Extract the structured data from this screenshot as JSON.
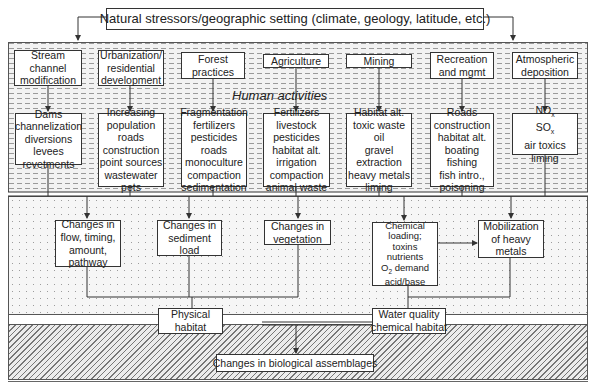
{
  "top": {
    "title": "Natural stressors/geographic setting (climate, geology, latitude, etc.)"
  },
  "human_activities": {
    "label": "Human activities",
    "categories": [
      {
        "label": [
          "Stream",
          "channel",
          "modification"
        ],
        "details": [
          "Dams",
          "channelization",
          "diversions",
          "levees",
          "revetments"
        ]
      },
      {
        "label": [
          "Urbanization/",
          "residential",
          "development"
        ],
        "details": [
          "Increasing",
          "population",
          "roads",
          "construction",
          "point sources",
          "wastewater",
          "pets"
        ]
      },
      {
        "label": [
          "Forest",
          "practices"
        ],
        "details": [
          "Fragmentation",
          "fertilizers",
          "pesticides",
          "roads",
          "monoculture",
          "compaction",
          "sedimentation"
        ]
      },
      {
        "label": [
          "Agriculture"
        ],
        "details": [
          "Fertilizers",
          "livestock",
          "pesticides",
          "habitat alt.",
          "irrigation",
          "compaction",
          "animal waste"
        ]
      },
      {
        "label": [
          "Mining"
        ],
        "details": [
          "Habitat alt.",
          "toxic waste",
          "oil",
          "gravel",
          "extraction",
          "heavy metals",
          "liming"
        ]
      },
      {
        "label": [
          "Recreation",
          "and mgmt"
        ],
        "details": [
          "Roads",
          "construction",
          "habitat alt.",
          "boating",
          "fishing",
          "fish intro.,",
          "poisoning"
        ]
      },
      {
        "label": [
          "Atmospheric",
          "deposition"
        ],
        "details": [
          "NOx",
          "SOx",
          "air toxics",
          "liming"
        ]
      }
    ]
  },
  "changes": [
    {
      "lines": [
        "Changes in",
        "flow, timing,",
        "amount,",
        "pathway"
      ]
    },
    {
      "lines": [
        "Changes in",
        "sediment",
        "load"
      ]
    },
    {
      "lines": [
        "Changes in",
        "vegetation"
      ]
    },
    {
      "lines": [
        "Chemical",
        "loading;",
        "toxins",
        "nutrients",
        "O2 demand",
        "acid/base"
      ]
    },
    {
      "lines": [
        "Mobilization",
        "of heavy",
        "metals"
      ]
    }
  ],
  "habitat": {
    "physical": [
      "Physical",
      "habitat"
    ],
    "water_quality": [
      "Water quality",
      "chemical habitat"
    ]
  },
  "outcome": {
    "label": "Changes in biological assemblages"
  },
  "colors": {
    "line": "#333333",
    "box_fill": "#ffffff",
    "pattern": "#9a9a9a"
  }
}
